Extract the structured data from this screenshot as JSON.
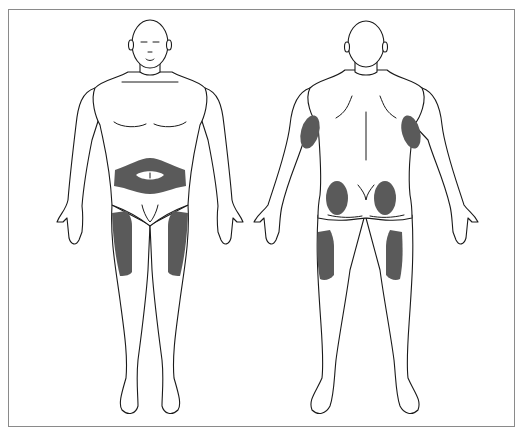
{
  "figure": {
    "title": "",
    "colors": {
      "background": "#ffffff",
      "border": "#8a8a8a",
      "outline": "#1a1a1a",
      "injection_site": "#5a5a5a"
    },
    "views": [
      {
        "name": "front",
        "highlighted_sites": [
          "abdomen",
          "left-front-thigh",
          "right-front-thigh"
        ]
      },
      {
        "name": "back",
        "highlighted_sites": [
          "left-upper-arm",
          "right-upper-arm",
          "left-buttock",
          "right-buttock",
          "left-outer-thigh",
          "right-outer-thigh"
        ]
      }
    ]
  }
}
